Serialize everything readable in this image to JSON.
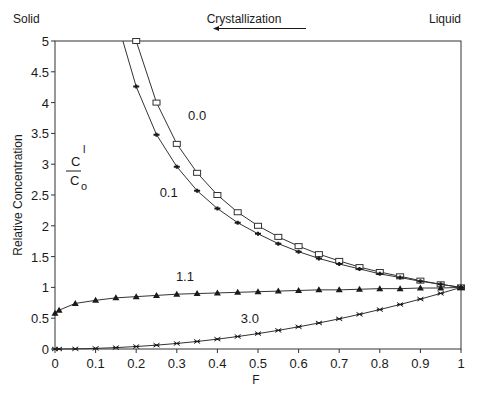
{
  "chart_data": {
    "type": "line",
    "title": "",
    "xlabel": "F",
    "ylabel": "Relative Concentration",
    "xlim": [
      0,
      1
    ],
    "ylim": [
      0,
      5
    ],
    "xticks": [
      "0",
      "0.1",
      "0.2",
      "0.3",
      "0.4",
      "0.5",
      "0.6",
      "0.7",
      "0.8",
      "0.9",
      "1"
    ],
    "yticks": [
      "0",
      "0.5",
      "1",
      "1.5",
      "2",
      "2.5",
      "3",
      "3.5",
      "4",
      "4.5",
      "5"
    ],
    "grid": false,
    "legend": "none (inline curve labels)",
    "annotations": {
      "top_left": "Solid",
      "top_right": "Liquid",
      "top_center": "Crystallization",
      "arrow_direction": "left",
      "ratio_numerator": "C",
      "ratio_numerator_superscript": "l",
      "ratio_denominator": "C",
      "ratio_denominator_subscript": "o"
    },
    "series": [
      {
        "name": "0.0",
        "marker": "open-square",
        "x": [
          0.2,
          0.25,
          0.3,
          0.35,
          0.4,
          0.45,
          0.5,
          0.55,
          0.6,
          0.65,
          0.7,
          0.75,
          0.8,
          0.85,
          0.9,
          0.95,
          1.0
        ],
        "y": [
          5.0,
          4.0,
          3.33,
          2.86,
          2.5,
          2.22,
          2.0,
          1.82,
          1.67,
          1.54,
          1.43,
          1.33,
          1.25,
          1.18,
          1.11,
          1.05,
          1.0
        ],
        "label_pos": [
          0.35,
          3.8
        ]
      },
      {
        "name": "0.1",
        "marker": "filled-star",
        "x": [
          0.2,
          0.25,
          0.3,
          0.35,
          0.4,
          0.45,
          0.5,
          0.55,
          0.6,
          0.65,
          0.7,
          0.75,
          0.8,
          0.85,
          0.9,
          0.95,
          1.0
        ],
        "y": [
          4.26,
          3.48,
          2.96,
          2.57,
          2.28,
          2.05,
          1.87,
          1.71,
          1.58,
          1.47,
          1.38,
          1.3,
          1.22,
          1.16,
          1.1,
          1.05,
          1.0
        ],
        "label_pos": [
          0.28,
          2.55
        ]
      },
      {
        "name": "1.1",
        "marker": "filled-triangle",
        "x": [
          0.0,
          0.01,
          0.05,
          0.1,
          0.15,
          0.2,
          0.25,
          0.3,
          0.35,
          0.4,
          0.45,
          0.5,
          0.55,
          0.6,
          0.65,
          0.7,
          0.75,
          0.8,
          0.85,
          0.9,
          0.95,
          1.0
        ],
        "y": [
          0.58,
          0.63,
          0.74,
          0.79,
          0.83,
          0.85,
          0.87,
          0.89,
          0.9,
          0.91,
          0.92,
          0.93,
          0.94,
          0.95,
          0.96,
          0.96,
          0.97,
          0.98,
          0.98,
          0.99,
          0.99,
          1.0
        ],
        "label_pos": [
          0.32,
          1.18
        ]
      },
      {
        "name": "3.0",
        "marker": "asterisk-x",
        "x": [
          0.0,
          0.01,
          0.05,
          0.1,
          0.15,
          0.2,
          0.25,
          0.3,
          0.35,
          0.4,
          0.45,
          0.5,
          0.55,
          0.6,
          0.65,
          0.7,
          0.75,
          0.8,
          0.85,
          0.9,
          0.95,
          1.0
        ],
        "y": [
          0.0,
          0.0,
          0.0025,
          0.01,
          0.0225,
          0.04,
          0.0625,
          0.09,
          0.1225,
          0.16,
          0.2025,
          0.25,
          0.3025,
          0.36,
          0.4225,
          0.49,
          0.5625,
          0.64,
          0.7225,
          0.81,
          0.9025,
          1.0
        ],
        "label_pos": [
          0.48,
          0.5
        ]
      }
    ]
  },
  "labels": {
    "solid": "Solid",
    "liquid": "Liquid",
    "crystallization": "Crystallization",
    "ylabel": "Relative Concentration",
    "xlabel": "F",
    "ratio_num": "C",
    "ratio_num_sup": "l",
    "ratio_den": "C",
    "ratio_den_sub": "o"
  }
}
